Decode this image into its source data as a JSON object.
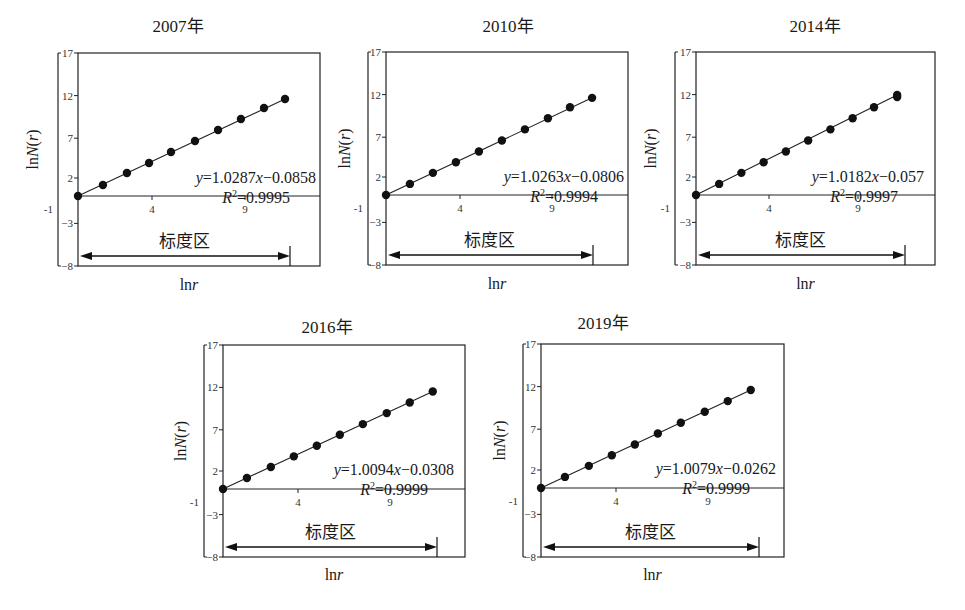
{
  "figure": {
    "x_axis_label": "lnr",
    "y_axis_label": "lnN(r)",
    "bracket_label": "标度区",
    "y_ticks": [
      17,
      12,
      7,
      2,
      -1,
      -3,
      -8
    ],
    "x_ticks": [
      4,
      9
    ]
  },
  "chart_data": [
    {
      "type": "scatter",
      "title": "2007年",
      "xlabel": "lnr",
      "ylabel": "lnN(r)",
      "ylim": [
        -8,
        17
      ],
      "x_ticks": [
        4,
        9
      ],
      "y_ticks": [
        17,
        12,
        7,
        2,
        -1,
        -3,
        -8
      ],
      "equation": "y=1.0287x−0.0858",
      "r_squared": "R²=0.9995",
      "fit": {
        "slope": 1.0287,
        "intercept": -0.0858
      },
      "bracket_label": "标度区",
      "scaling_region": [
        0,
        11.2
      ],
      "x": [
        0,
        1.34,
        2.63,
        3.82,
        5.0,
        6.29,
        7.53,
        8.76,
        10.0,
        11.13
      ],
      "y": [
        0,
        1.29,
        2.7,
        3.87,
        5.16,
        6.46,
        7.75,
        9.04,
        10.33,
        11.38
      ]
    },
    {
      "type": "scatter",
      "title": "2010年",
      "xlabel": "lnr",
      "ylabel": "lnN(r)",
      "ylim": [
        -8,
        17
      ],
      "x_ticks": [
        4,
        9
      ],
      "y_ticks": [
        17,
        12,
        7,
        2,
        -1,
        -3,
        -8
      ],
      "equation": "y=1.0263x−0.0806",
      "r_squared": "R²=0.9994",
      "fit": {
        "slope": 1.0263,
        "intercept": -0.0806
      },
      "bracket_label": "标度区",
      "scaling_region": [
        0,
        11.2
      ],
      "x": [
        0,
        1.3,
        2.55,
        3.8,
        5.05,
        6.3,
        7.55,
        8.8,
        10.0,
        11.2
      ],
      "y": [
        0,
        1.3,
        2.6,
        3.85,
        5.1,
        6.4,
        7.7,
        9.0,
        10.3,
        11.4
      ]
    },
    {
      "type": "scatter",
      "title": "2014年",
      "xlabel": "lnr",
      "ylabel": "lnN(r)",
      "ylim": [
        -8,
        17
      ],
      "x_ticks": [
        4,
        9
      ],
      "y_ticks": [
        17,
        12,
        7,
        2,
        -1,
        -3,
        -8
      ],
      "equation": "y=1.0182x−0.057",
      "r_squared": "R²=0.9997",
      "fit": {
        "slope": 1.0182,
        "intercept": -0.057
      },
      "bracket_label": "标度区",
      "scaling_region": [
        0,
        11.8
      ],
      "x": [
        0,
        1.3,
        2.55,
        3.8,
        5.05,
        6.3,
        7.55,
        8.8,
        10.0,
        11.3,
        11.3
      ],
      "y": [
        0,
        1.3,
        2.6,
        3.85,
        5.1,
        6.4,
        7.7,
        9.0,
        10.3,
        11.5,
        11.75
      ]
    },
    {
      "type": "scatter",
      "title": "2016年",
      "xlabel": "lnr",
      "ylabel": "lnN(r)",
      "ylim": [
        -8,
        17
      ],
      "x_ticks": [
        4,
        9
      ],
      "y_ticks": [
        17,
        12,
        7,
        2,
        -1,
        -3,
        -8
      ],
      "equation": "y=1.0094x−0.0308",
      "r_squared": "R²=0.9999",
      "fit": {
        "slope": 1.0094,
        "intercept": -0.0308
      },
      "bracket_label": "标度区",
      "scaling_region": [
        0,
        11.6
      ],
      "x": [
        0,
        1.3,
        2.6,
        3.85,
        5.1,
        6.35,
        7.6,
        8.9,
        10.15,
        11.4
      ],
      "y": [
        0,
        1.3,
        2.6,
        3.85,
        5.1,
        6.4,
        7.65,
        8.95,
        10.2,
        11.5
      ]
    },
    {
      "type": "scatter",
      "title": "2019年",
      "xlabel": "lnr",
      "ylabel": "lnN(r)",
      "ylim": [
        -8,
        17
      ],
      "x_ticks": [
        4,
        9
      ],
      "y_ticks": [
        17,
        12,
        7,
        2,
        -1,
        -3,
        -8
      ],
      "equation": "y=1.0079x−0.0262",
      "r_squared": "R²=0.9999",
      "fit": {
        "slope": 1.0079,
        "intercept": -0.0262
      },
      "bracket_label": "标度区",
      "scaling_region": [
        0,
        11.7
      ],
      "x": [
        0,
        1.3,
        2.6,
        3.85,
        5.1,
        6.35,
        7.6,
        8.9,
        10.15,
        11.4
      ],
      "y": [
        0,
        1.3,
        2.6,
        3.85,
        5.1,
        6.4,
        7.65,
        8.95,
        10.2,
        11.5
      ]
    }
  ]
}
